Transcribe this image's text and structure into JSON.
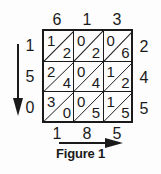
{
  "caption": "Figure 1",
  "top_digits": [
    "6",
    "1",
    "3"
  ],
  "left_digits": [
    "1",
    "5",
    "0"
  ],
  "right_digits": [
    "2",
    "4",
    "5"
  ],
  "bottom_digits": [
    "1",
    "8",
    "5"
  ],
  "cells": [
    [
      {
        "tens": "1",
        "ones": "2"
      },
      {
        "tens": "0",
        "ones": "2"
      },
      {
        "tens": "0",
        "ones": "6"
      }
    ],
    [
      {
        "tens": "2",
        "ones": "4"
      },
      {
        "tens": "0",
        "ones": "4"
      },
      {
        "tens": "1",
        "ones": "2"
      }
    ],
    [
      {
        "tens": "3",
        "ones": "0"
      },
      {
        "tens": "0",
        "ones": "5"
      },
      {
        "tens": "1",
        "ones": "5"
      }
    ]
  ],
  "arrows": {
    "vertical": "down-arrow",
    "horizontal": "right-arrow"
  },
  "colors": {
    "ink": "#1a1a1a",
    "background": "#fdfdfd"
  }
}
